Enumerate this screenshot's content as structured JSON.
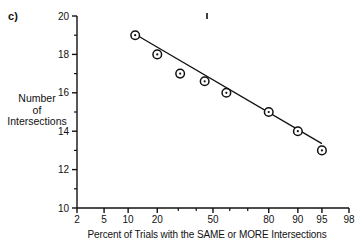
{
  "panel": {
    "label": "c)"
  },
  "chart_data": {
    "type": "scatter",
    "title": "",
    "subtitle": "",
    "xlabel": "Percent of Trials with the SAME or MORE Intersections",
    "ylabel": "Number\nof\nIntersections",
    "ylabel_lines": [
      "Number",
      "of",
      "Intersections"
    ],
    "x_scale": "probability",
    "x_ticks_labeled": [
      2,
      5,
      10,
      20,
      50,
      80,
      90,
      95,
      98
    ],
    "x_tick_labels": [
      "2",
      "5",
      "10",
      "20",
      "50",
      "80",
      "90",
      "95",
      "98"
    ],
    "x_ticks_minor": [
      30,
      40,
      60,
      70
    ],
    "xlim": [
      2,
      98
    ],
    "y_ticks": [
      10,
      12,
      14,
      16,
      18,
      20
    ],
    "y_tick_labels": [
      "10",
      "12",
      "14",
      "16",
      "18",
      "20"
    ],
    "ylim": [
      10,
      20
    ],
    "grid": false,
    "legend": false,
    "marker": "circle-with-center-dot",
    "series": [
      {
        "name": "Intersections",
        "x": [
          12,
          20,
          31,
          45,
          58,
          80,
          90,
          95
        ],
        "values": [
          19,
          18,
          17,
          17,
          16,
          15,
          14,
          13
        ],
        "points": [
          {
            "x": 12,
            "y": 19
          },
          {
            "x": 20,
            "y": 18
          },
          {
            "x": 31,
            "y": 17
          },
          {
            "x": 45,
            "y": 16.6
          },
          {
            "x": 58,
            "y": 16
          },
          {
            "x": 80,
            "y": 15
          },
          {
            "x": 90,
            "y": 14
          },
          {
            "x": 95,
            "y": 13
          }
        ]
      }
    ],
    "fit_line": {
      "name": "fitted straight line",
      "x_start": 12,
      "y_start": 19.05,
      "x_end": 95,
      "y_end": 13.35
    },
    "annotations": [
      {
        "name": "tick-mark-artifact",
        "x": 207,
        "y": 16,
        "text": ""
      }
    ]
  }
}
